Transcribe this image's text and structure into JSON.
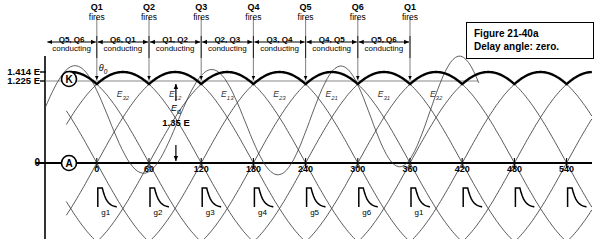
{
  "figure": {
    "caption_line1": "Figure 21-40a",
    "caption_line2": "Delay angle: zero."
  },
  "axis": {
    "y_labels": [
      {
        "text": "1.414 E",
        "value": 1.414
      },
      {
        "text": "1.225 E",
        "value": 1.225
      }
    ],
    "zero_label": "0",
    "x_ticks": [
      "0",
      "60",
      "120",
      "180",
      "240",
      "300",
      "360",
      "420",
      "480",
      "540"
    ],
    "node_k": "K",
    "node_a": "A",
    "theta_label": "θ0"
  },
  "firing": {
    "fires_word": "fires",
    "devices": [
      "Q1",
      "Q2",
      "Q3",
      "Q4",
      "Q5",
      "Q6",
      "Q1"
    ]
  },
  "conducting": {
    "word": "conducting",
    "pairs": [
      "Q5, Q6",
      "Q6, Q1",
      "Q1, Q2",
      "Q2, Q3",
      "Q3, Q4",
      "Q4, Q5",
      "Q5, Q6"
    ]
  },
  "voltages": {
    "names": [
      "E32",
      "E12",
      "E13",
      "E23",
      "E21",
      "E31",
      "E32"
    ],
    "subs": [
      {
        "main": "E",
        "sub": "32"
      },
      {
        "main": "E",
        "sub": "12"
      },
      {
        "main": "E",
        "sub": "13"
      },
      {
        "main": "E",
        "sub": "23"
      },
      {
        "main": "E",
        "sub": "21"
      },
      {
        "main": "E",
        "sub": "31"
      },
      {
        "main": "E",
        "sub": "32"
      }
    ]
  },
  "output": {
    "ed_label": "Ed",
    "ed_value": "1.35 E"
  },
  "gates": {
    "labels": [
      "g1",
      "g2",
      "g3",
      "g4",
      "g5",
      "g6",
      "g1",
      "",
      "",
      ""
    ]
  },
  "colors": {
    "ink": "#000000",
    "thin": "#3a3a3a",
    "background": "#ffffff"
  },
  "chart_data": {
    "type": "line",
    "xlabel": "",
    "ylabel": "",
    "xlim": [
      -30,
      600
    ],
    "ylim": [
      -1.414,
      1.414
    ],
    "x_tick_values": [
      0,
      60,
      120,
      180,
      240,
      300,
      360,
      420,
      480,
      540
    ],
    "x_tick_labels": [
      "0",
      "60",
      "120",
      "180",
      "240",
      "300",
      "360",
      "420",
      "480",
      "540"
    ],
    "y_tick_values": [
      0,
      1.225,
      1.414
    ],
    "y_tick_labels": [
      "0",
      "1.225 E",
      "1.414 E"
    ],
    "grid": false,
    "legend": false,
    "series": [
      {
        "name": "E32",
        "type": "sine",
        "amplitude": 1.414,
        "phase_deg": 0,
        "peak_deg": 90
      },
      {
        "name": "E12",
        "type": "sine",
        "amplitude": 1.414,
        "phase_deg": 60,
        "peak_deg": 150
      },
      {
        "name": "E13",
        "type": "sine",
        "amplitude": 1.414,
        "phase_deg": 120,
        "peak_deg": 210
      },
      {
        "name": "E23",
        "type": "sine",
        "amplitude": 1.414,
        "phase_deg": 180,
        "peak_deg": 270
      },
      {
        "name": "E21",
        "type": "sine",
        "amplitude": 1.414,
        "phase_deg": 240,
        "peak_deg": 330
      },
      {
        "name": "E31",
        "type": "sine",
        "amplitude": 1.414,
        "phase_deg": 300,
        "peak_deg": 390
      }
    ],
    "envelope": {
      "name": "K (rectified output envelope)",
      "peak": 1.414,
      "min": 1.225,
      "average": 1.35,
      "period_deg": 60
    },
    "annotations": [
      {
        "text": "Ed = 1.35 E",
        "at_deg": 150
      },
      {
        "text": "θ0",
        "at_deg": 0
      },
      {
        "text": "K",
        "at_deg": -15
      },
      {
        "text": "A",
        "at_deg": -15
      }
    ],
    "firing_points_deg": [
      0,
      60,
      120,
      180,
      240,
      300,
      360
    ],
    "gate_pulse_deg": [
      0,
      60,
      120,
      180,
      240,
      300,
      360,
      420,
      480,
      540
    ]
  }
}
